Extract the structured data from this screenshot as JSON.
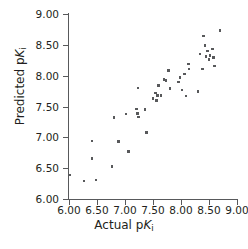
{
  "chart_data": {
    "type": "scatter",
    "title": "",
    "xlabel": "Actual pKi",
    "ylabel": "Predicted pKi",
    "xlabel_parts": {
      "prefix": "Actual p",
      "symbol": "K",
      "subscript": "i"
    },
    "ylabel_parts": {
      "prefix": "Predicted p",
      "symbol": "K",
      "subscript": "i"
    },
    "xlim": [
      6.0,
      9.0
    ],
    "ylim": [
      6.0,
      9.0
    ],
    "xticks": [
      6.0,
      6.5,
      7.0,
      7.5,
      8.0,
      8.5,
      9.0
    ],
    "yticks": [
      6.0,
      6.5,
      7.0,
      7.5,
      8.0,
      8.5,
      9.0
    ],
    "xtick_labels": [
      "6.00",
      "6.50",
      "7.00",
      "7.50",
      "8.00",
      "8.50",
      "9.00"
    ],
    "ytick_labels": [
      "6.00",
      "6.50",
      "7.00",
      "7.50",
      "8.00",
      "8.50",
      "9.00"
    ],
    "grid": false,
    "legend": false,
    "marker": "square",
    "marker_color": "#58595b",
    "axis_color": "#58595b",
    "text_color": "#231f20",
    "background": "#ffffff",
    "points": [
      [
        6.02,
        6.39
      ],
      [
        6.27,
        6.29
      ],
      [
        6.41,
        6.94
      ],
      [
        6.41,
        6.66
      ],
      [
        6.48,
        6.31
      ],
      [
        6.77,
        6.53
      ],
      [
        6.8,
        7.32
      ],
      [
        6.88,
        6.93
      ],
      [
        7.02,
        7.38
      ],
      [
        7.06,
        6.77
      ],
      [
        7.21,
        7.46
      ],
      [
        7.22,
        7.39
      ],
      [
        7.23,
        7.8
      ],
      [
        7.24,
        7.33
      ],
      [
        7.36,
        7.45
      ],
      [
        7.38,
        7.08
      ],
      [
        7.5,
        7.63
      ],
      [
        7.54,
        7.72
      ],
      [
        7.56,
        7.6
      ],
      [
        7.58,
        7.68
      ],
      [
        7.6,
        7.84
      ],
      [
        7.64,
        7.68
      ],
      [
        7.7,
        7.94
      ],
      [
        7.73,
        7.92
      ],
      [
        7.78,
        8.08
      ],
      [
        7.8,
        7.79
      ],
      [
        7.96,
        7.9
      ],
      [
        7.98,
        7.97
      ],
      [
        8.02,
        7.77
      ],
      [
        8.06,
        8.03
      ],
      [
        8.09,
        7.67
      ],
      [
        8.13,
        8.19
      ],
      [
        8.14,
        8.11
      ],
      [
        8.3,
        7.74
      ],
      [
        8.34,
        8.35
      ],
      [
        8.38,
        8.11
      ],
      [
        8.4,
        8.64
      ],
      [
        8.43,
        8.49
      ],
      [
        8.45,
        8.31
      ],
      [
        8.47,
        8.4
      ],
      [
        8.5,
        8.26
      ],
      [
        8.52,
        8.33
      ],
      [
        8.56,
        8.43
      ],
      [
        8.58,
        8.29
      ],
      [
        8.6,
        8.16
      ],
      [
        8.7,
        8.73
      ]
    ]
  }
}
